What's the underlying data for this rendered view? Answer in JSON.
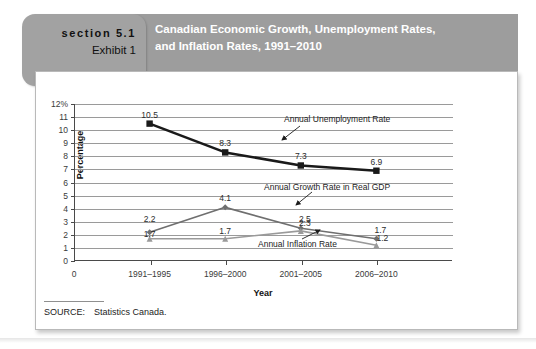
{
  "header": {
    "section_label": "section 5.1",
    "exhibit_label": "Exhibit 1",
    "title_line1": "Canadian Economic Growth, Unemployment Rates,",
    "title_line2": "and Inflation Rates, 1991–2010",
    "band_color": "#9d9d9d",
    "tab_color": "#a2a2a2",
    "title_color": "#ffffff"
  },
  "source": {
    "label": "SOURCE:",
    "value": "Statistics Canada."
  },
  "axes": {
    "y_title": "Percentage",
    "x_title": "Year",
    "y_tick_labels": [
      "12%",
      "11",
      "10",
      "9",
      "8",
      "7",
      "6",
      "5",
      "4",
      "3",
      "2",
      "1",
      "0"
    ],
    "x_origin_label": "0"
  },
  "chart_data": {
    "type": "line",
    "title": "Canadian Economic Growth, Unemployment Rates, and Inflation Rates, 1991–2010",
    "xlabel": "Year",
    "ylabel": "Percentage",
    "ylim": [
      0,
      12
    ],
    "ytick_step": 1,
    "grid": true,
    "legend_position": "inline-annotations",
    "categories": [
      "1991–1995",
      "1996–2000",
      "2001–2005",
      "2006–2010"
    ],
    "series": [
      {
        "name": "Annual Unemployment Rate",
        "values": [
          10.5,
          8.3,
          7.3,
          6.9
        ],
        "color": "#1a1a1a",
        "marker": "square",
        "line_width": 2.6,
        "labels": [
          "10.5",
          "8.3",
          "7.3",
          "6.9"
        ]
      },
      {
        "name": "Annual Growth Rate in Real GDP",
        "values": [
          2.2,
          4.1,
          2.5,
          1.7
        ],
        "color": "#6f6f6f",
        "marker": "diamond",
        "line_width": 1.6,
        "labels": [
          "2.2",
          "4.1",
          "2.5",
          "1.7"
        ]
      },
      {
        "name": "Annual Inflation Rate",
        "values": [
          1.7,
          1.7,
          2.3,
          1.2
        ],
        "color": "#9a9a9a",
        "marker": "triangle",
        "line_width": 1.6,
        "labels": [
          "1.7",
          "1.7",
          "2.3",
          "1.2"
        ]
      }
    ],
    "annotations": [
      {
        "text": "Annual Unemployment Rate",
        "series": "Annual Unemployment Rate"
      },
      {
        "text": "Annual Growth Rate in Real GDP",
        "series": "Annual Growth Rate in Real GDP"
      },
      {
        "text": "Annual Inflation Rate",
        "series": "Annual Inflation Rate"
      }
    ]
  }
}
